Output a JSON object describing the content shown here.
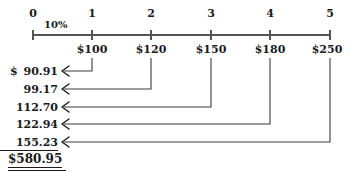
{
  "diagram": {
    "type": "cash-flow-timeline",
    "interest_rate_label": "10%",
    "axis": {
      "tick_labels": [
        "0",
        "1",
        "2",
        "3",
        "4",
        "5"
      ],
      "tick_x": [
        33,
        92,
        151,
        211,
        270,
        330
      ],
      "axis_y": 35
    },
    "cash_flows": [
      {
        "period": "1",
        "label": "$100",
        "x": 92
      },
      {
        "period": "2",
        "label": "$120",
        "x": 151
      },
      {
        "period": "3",
        "label": "$150",
        "x": 211
      },
      {
        "period": "4",
        "label": "$180",
        "x": 270
      },
      {
        "period": "5",
        "label": "$250",
        "x": 330
      }
    ],
    "present_values": [
      {
        "currency": "$",
        "amount": "90.91",
        "row_y": 71,
        "from_x": 92,
        "underline": false
      },
      {
        "currency": "",
        "amount": "99.17",
        "row_y": 89,
        "from_x": 151,
        "underline": false
      },
      {
        "currency": "",
        "amount": "112.70",
        "row_y": 107,
        "from_x": 211,
        "underline": false
      },
      {
        "currency": "",
        "amount": "122.94",
        "row_y": 124,
        "from_x": 270,
        "underline": false
      },
      {
        "currency": "",
        "amount": "155.23",
        "row_y": 142,
        "from_x": 330,
        "underline": true
      }
    ],
    "total": "$580.95",
    "arrow_head_x": 62,
    "colors": {
      "ink": "#1a1a1a",
      "rule": "#555555",
      "background": "#ffffff"
    }
  }
}
